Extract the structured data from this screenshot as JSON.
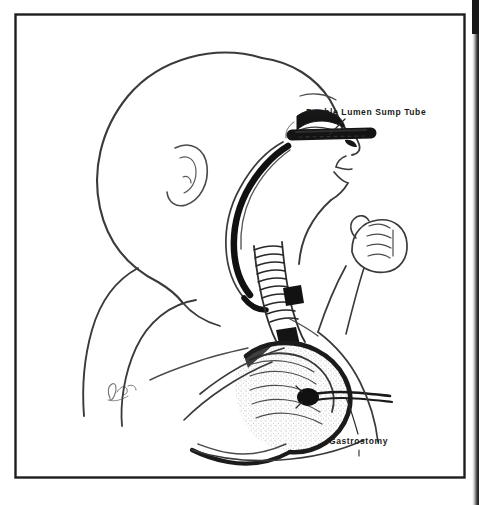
{
  "figure": {
    "kind": "medical-line-illustration",
    "orientation": "left-facing profile, head to upper left, torso to lower right",
    "frame": {
      "style": "thin black rectangular rule border",
      "color": "#1a1a1a",
      "left": 15,
      "top": 14,
      "right": 465,
      "bottom": 478
    },
    "background_color": "#ffffff",
    "ink_color": "#2b2b2b",
    "fill_black": "#141414",
    "page_edge_strip": {
      "present": true,
      "description": "dark scanned page gutter along the extreme right edge",
      "color": "#1d1d1d"
    }
  },
  "labels": [
    {
      "id": "double-lumen-sump-tube",
      "text": "Double Lumen Sump Tube",
      "x": 306,
      "y": 108,
      "leader_line": true,
      "leader_from": [
        345,
        120
      ],
      "leader_to": [
        331,
        133
      ],
      "points_to": "thick black tube entering the nares / upper airway"
    },
    {
      "id": "gastrostomy",
      "text": "Gastrostomy",
      "x": 329,
      "y": 437,
      "leader_line": true,
      "leader_from": [
        358,
        435
      ],
      "leader_to": [
        345,
        400
      ],
      "points_to": "tube entering the anterior stomach wall"
    }
  ],
  "anatomy": [
    {
      "id": "cranium",
      "label": "Infant head / cranium in profile"
    },
    {
      "id": "ear",
      "label": "Auricle (external ear)"
    },
    {
      "id": "eye",
      "label": "Eye with closed lid"
    },
    {
      "id": "nose",
      "label": "Nose and nares"
    },
    {
      "id": "mouth-chin",
      "label": "Mouth and chin"
    },
    {
      "id": "esophageal-pouch",
      "label": "Blind upper esophageal pouch (solid black)"
    },
    {
      "id": "trachea",
      "label": "Trachea with cartilage rings"
    },
    {
      "id": "fistula",
      "label": "Tracheoesophageal fistula"
    },
    {
      "id": "distal-esophagus",
      "label": "Distal esophagus to stomach"
    },
    {
      "id": "stomach",
      "label": "Stomach (stippled / shaded)"
    },
    {
      "id": "shoulder-arm",
      "label": "Shoulder, upper arm and forearm"
    },
    {
      "id": "hand",
      "label": "Clenched fist"
    },
    {
      "id": "torso",
      "label": "Chest and abdominal wall"
    },
    {
      "id": "signature",
      "label": "Artist signature (illegible script)"
    }
  ],
  "devices": [
    {
      "id": "sump-tube",
      "name": "Double Lumen Sump Tube",
      "rendering": "heavy solid black tube",
      "path": "enters through the nares, passes posteriorly, terminates in the blind upper esophageal pouch"
    },
    {
      "id": "gastrostomy-tube",
      "name": "Gastrostomy",
      "rendering": "thin black catheter",
      "path": "passes through the anterior abdominal wall into the stomach lumen"
    }
  ]
}
